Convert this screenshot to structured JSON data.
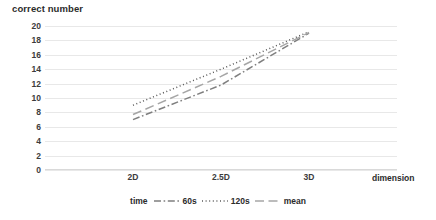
{
  "chart_data": {
    "type": "line",
    "title": "",
    "ylabel": "correct number",
    "xlabel": "dimension",
    "categories": [
      "2D",
      "2.5D",
      "3D"
    ],
    "ylim": [
      0,
      20
    ],
    "ytick_step": 2,
    "yticks": [
      "20",
      "18",
      "16",
      "14",
      "12",
      "10",
      "8",
      "6",
      "4",
      "2",
      "0"
    ],
    "grid": true,
    "legend_position": "bottom",
    "legend_title": "time",
    "series": [
      {
        "name": "60s",
        "style": "dash-dot",
        "color": "#7f7f7f",
        "values": [
          7.0,
          11.8,
          19.0
        ]
      },
      {
        "name": "120s",
        "style": "dotted",
        "color": "#595959",
        "values": [
          9.0,
          14.0,
          19.2
        ]
      },
      {
        "name": "mean",
        "style": "long-dash",
        "color": "#a6a6a6",
        "values": [
          7.7,
          13.0,
          19.1
        ]
      }
    ]
  },
  "colors": {
    "gridline": "#e8e8e8",
    "axis": "#d9d9d9",
    "text": "#3c3c3c",
    "background": "#ffffff"
  }
}
